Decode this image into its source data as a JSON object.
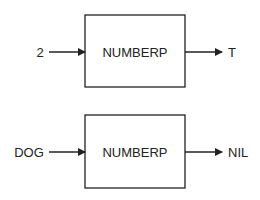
{
  "diagram": {
    "rows": [
      {
        "input": "2",
        "function": "NUMBERP",
        "output": "T"
      },
      {
        "input": "DOG",
        "function": "NUMBERP",
        "output": "NIL"
      }
    ],
    "colors": {
      "stroke": "#222222",
      "text": "#222222",
      "background": "#ffffff"
    }
  }
}
